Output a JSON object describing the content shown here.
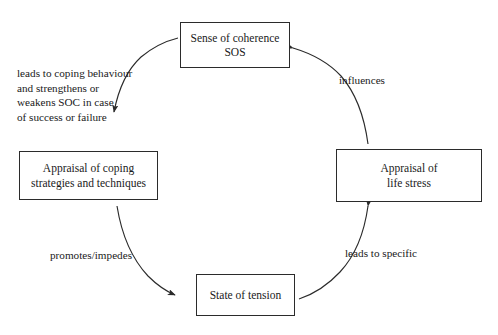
{
  "diagram": {
    "nodes": [
      {
        "id": "sos",
        "name": "node-sos",
        "text": "Sense of coherence\nSOS"
      },
      {
        "id": "appraisal-life-stress",
        "name": "node-appraisal-life-stress",
        "text": "Appraisal of\nlife stress"
      },
      {
        "id": "state-of-tension",
        "name": "node-state-of-tension",
        "text": "State of tension"
      },
      {
        "id": "appraisal-coping",
        "name": "node-appraisal-coping",
        "text": "Appraisal of coping\nstrategies and techniques"
      }
    ],
    "edges": [
      {
        "id": "influences",
        "from": "sos",
        "to": "appraisal-life-stress",
        "label": "influences"
      },
      {
        "id": "leads-to-specific",
        "from": "state-of-tension",
        "to": "appraisal-life-stress",
        "label": "leads to specific"
      },
      {
        "id": "promotes-impedes",
        "from": "appraisal-coping",
        "to": "state-of-tension",
        "label": "promotes/impedes"
      },
      {
        "id": "soc-feedback",
        "from": "appraisal-coping",
        "to": "sos",
        "label": "leads to coping behaviour\nand strengthens or\nweakens SOC in case\nof success or failure"
      }
    ],
    "style": {
      "stroke": "#2b2b2b",
      "background": "#ffffff",
      "text_color": "#1a1a1a"
    }
  }
}
